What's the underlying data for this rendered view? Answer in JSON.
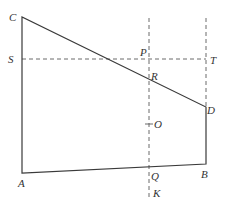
{
  "diagram": {
    "type": "geometry-figure",
    "stroke_color": "#3a3a3a",
    "dash_color": "#5a5a5a",
    "points": {
      "C": {
        "label": "C",
        "x": 22,
        "y": 17
      },
      "A": {
        "label": "A",
        "x": 22,
        "y": 173
      },
      "B": {
        "label": "B",
        "x": 206,
        "y": 164
      },
      "D": {
        "label": "D",
        "x": 206,
        "y": 107
      },
      "S": {
        "label": "S",
        "x": 22,
        "y": 59
      },
      "T": {
        "label": "T",
        "x": 206,
        "y": 59
      },
      "P": {
        "label": "P",
        "x": 149,
        "y": 59
      },
      "R": {
        "label": "R",
        "x": 149,
        "y": 76
      },
      "O": {
        "label": "O",
        "x": 149,
        "y": 124
      },
      "Q": {
        "label": "Q",
        "x": 149,
        "y": 168
      },
      "K": {
        "label": "K",
        "x": 149,
        "y": 196
      }
    },
    "labels": {
      "C": "C",
      "S": "S",
      "A": "A",
      "P": "P",
      "R": "R",
      "T": "T",
      "D": "D",
      "O": "O",
      "Q": "Q",
      "B": "B",
      "K": "K"
    },
    "solid_segments": [
      "C-A",
      "A-B",
      "B-D",
      "D-C"
    ],
    "dashed_segments": [
      "S-T",
      "vertical line through P, R, O, Q, K",
      "vertical line through T above D"
    ]
  }
}
